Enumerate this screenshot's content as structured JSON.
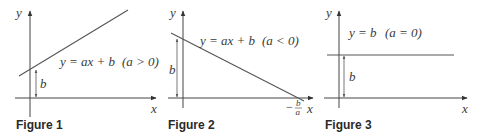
{
  "figures": [
    {
      "caption": "Figure 1",
      "equation": "y = ax + b",
      "condition": "(a > 0)",
      "y_axis_label": "y",
      "x_axis_label": "x",
      "intercept_label": "b",
      "slope": "positive"
    },
    {
      "caption": "Figure 2",
      "equation": "y = ax + b",
      "condition": "(a < 0)",
      "y_axis_label": "y",
      "x_axis_label": "x",
      "intercept_label": "b",
      "x_intercept_label_num": "b",
      "x_intercept_label_den": "a",
      "x_intercept_sign": "−",
      "slope": "negative"
    },
    {
      "caption": "Figure 3",
      "equation": "y = b",
      "condition": "(a = 0)",
      "y_axis_label": "y",
      "x_axis_label": "x",
      "intercept_label": "b",
      "slope": "zero"
    }
  ],
  "colors": {
    "line": "#555555",
    "text": "#3a3a3a",
    "caption": "#2a2a2a"
  }
}
